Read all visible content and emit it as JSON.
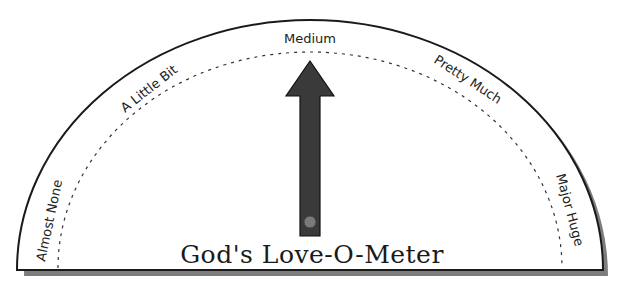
{
  "meter": {
    "title": "God's Love-O-Meter",
    "labels": {
      "almost_none": "Almost None",
      "a_little_bit": "A Little Bit",
      "medium": "Medium",
      "pretty_much": "Pretty Much",
      "major_huge": "Major Huge"
    },
    "pointer": {
      "position": "Medium",
      "color": "#3a3a3a",
      "pivot_color": "#7a7a7a"
    },
    "colors": {
      "outline": "#1a1a1a",
      "shadow": "#777777",
      "fill": "#ffffff"
    }
  }
}
